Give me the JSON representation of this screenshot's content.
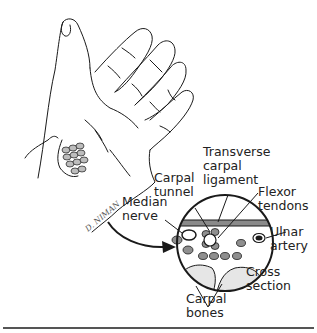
{
  "figure": {
    "type": "medical illustration",
    "signature": "D. NIMAN",
    "colors": {
      "ink": "#1a1a1a",
      "shade": "#9a9a9a",
      "light": "#cfcfcf",
      "rule": "#555555"
    }
  },
  "labels": {
    "transverse_carpal_ligament": [
      "Transverse",
      "carpal",
      "ligament"
    ],
    "carpal_tunnel": [
      "Carpal",
      "tunnel"
    ],
    "flexor_tendons": [
      "Flexor",
      "tendons"
    ],
    "median_nerve": [
      "Median",
      "nerve"
    ],
    "ulnar_artery": [
      "Ulnar",
      "artery"
    ],
    "cross_section": [
      "Cross",
      "section"
    ],
    "carpal_bones": [
      "Carpal",
      "bones"
    ]
  }
}
